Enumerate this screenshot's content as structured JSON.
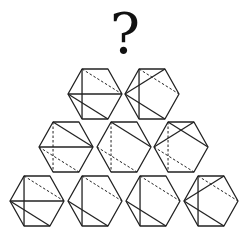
{
  "title_symbol": "?",
  "colors": {
    "line": "#222222",
    "background": "#ffffff"
  },
  "hexagon": {
    "radius": 27,
    "half_height": 25,
    "orientation": "flat-top"
  },
  "vertex_names": [
    "L",
    "TL",
    "TR",
    "R",
    "BR",
    "BL"
  ],
  "rows": [
    {
      "row": 1,
      "figures": [
        {
          "id": "r1a",
          "cx": 95,
          "cy": 94,
          "solid": [
            [
              "TL",
              "BL"
            ],
            [
              "L",
              "R"
            ],
            [
              "L",
              "BR"
            ]
          ],
          "dashed": [
            [
              "TL",
              "R"
            ]
          ]
        },
        {
          "id": "r1b",
          "cx": 152,
          "cy": 94,
          "solid": [
            [
              "TL",
              "BL"
            ],
            [
              "L",
              "TR"
            ],
            [
              "L",
              "BR"
            ]
          ],
          "dashed": [
            [
              "TL",
              "R"
            ]
          ]
        }
      ]
    },
    {
      "row": 2,
      "figures": [
        {
          "id": "r2a",
          "cx": 66,
          "cy": 147,
          "solid": [
            [
              "TL",
              "R"
            ],
            [
              "L",
              "R"
            ]
          ],
          "dashed": [
            [
              "TL",
              "BL"
            ],
            [
              "L",
              "BR"
            ]
          ]
        },
        {
          "id": "r2b",
          "cx": 124,
          "cy": 147,
          "solid": [
            [
              "TL",
              "R"
            ]
          ],
          "dashed": [
            [
              "TL",
              "BL"
            ],
            [
              "L",
              "BR"
            ]
          ]
        },
        {
          "id": "r2c",
          "cx": 181,
          "cy": 147,
          "solid": [
            [
              "TL",
              "R"
            ],
            [
              "L",
              "TR"
            ]
          ],
          "dashed": [
            [
              "TL",
              "BL"
            ],
            [
              "L",
              "BR"
            ]
          ]
        }
      ]
    },
    {
      "row": 3,
      "figures": [
        {
          "id": "r3a",
          "cx": 37,
          "cy": 201,
          "solid": [
            [
              "TL",
              "BL"
            ],
            [
              "L",
              "R"
            ],
            [
              "L",
              "BR"
            ]
          ],
          "dashed": [
            [
              "TL",
              "R"
            ]
          ]
        },
        {
          "id": "r3b",
          "cx": 95,
          "cy": 201,
          "solid": [
            [
              "TL",
              "BL"
            ],
            [
              "L",
              "BR"
            ]
          ],
          "dashed": [
            [
              "TL",
              "R"
            ]
          ]
        },
        {
          "id": "r3c",
          "cx": 153,
          "cy": 201,
          "solid": [
            [
              "TL",
              "BL"
            ],
            [
              "L",
              "BR"
            ]
          ],
          "dashed": [
            [
              "TL",
              "R"
            ]
          ]
        },
        {
          "id": "r3d",
          "cx": 211,
          "cy": 201,
          "solid": [
            [
              "TL",
              "BL"
            ],
            [
              "L",
              "TR"
            ],
            [
              "L",
              "BR"
            ]
          ],
          "dashed": [
            [
              "TL",
              "R"
            ]
          ]
        }
      ]
    }
  ]
}
